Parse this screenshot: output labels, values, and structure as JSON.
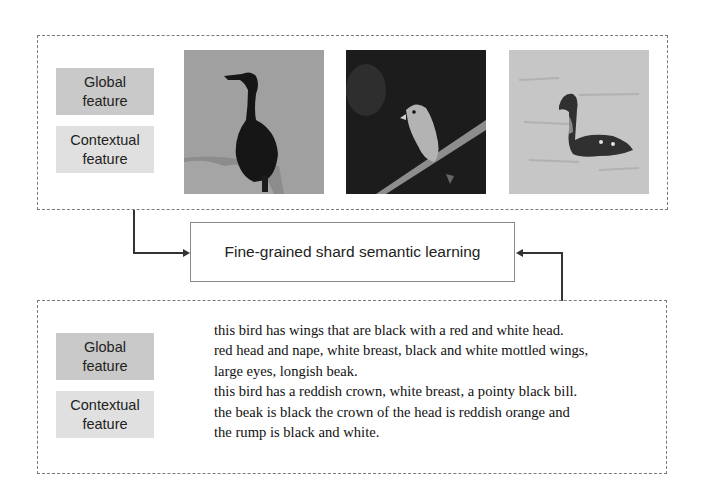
{
  "top_panel": {
    "tags": {
      "global": "Global feature",
      "global_line1": "Global",
      "global_line2": "feature",
      "contextual_line1": "Contextual",
      "contextual_line2": "feature"
    },
    "images": [
      {
        "subject": "black cormorant standing on rock",
        "background": "#9a9a9a"
      },
      {
        "subject": "small bird perched on branch",
        "background": "#1e1e1e"
      },
      {
        "subject": "duck swimming on water",
        "background": "#c4c4c4"
      }
    ]
  },
  "center": {
    "label": "Fine-grained shard semantic learning"
  },
  "bottom_panel": {
    "tags": {
      "global_line1": "Global",
      "global_line2": "feature",
      "contextual_line1": "Contextual",
      "contextual_line2": "feature"
    },
    "descriptions": [
      "this bird has wings that are black with a red and white head.",
      "red head and nape, white breast, black and white mottled wings,",
      "large eyes, longish beak.",
      "this bird has a reddish crown, white breast, a pointy black bill.",
      "the beak is black the crown of the head is reddish orange and",
      "the rump is black and white."
    ]
  },
  "colors": {
    "global_tag": "#c9c9c9",
    "contextual_tag": "#e0e0e0",
    "border": "#7a7a7a",
    "arrow": "#333333"
  }
}
